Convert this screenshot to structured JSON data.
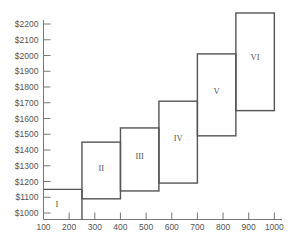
{
  "chart_data": {
    "type": "bar",
    "subtype": "variable-width step boxes",
    "title": "",
    "xlabel": "",
    "ylabel": "",
    "x_ticks": [
      100,
      200,
      300,
      400,
      500,
      600,
      700,
      800,
      900,
      1000
    ],
    "y_ticks": [
      "$1000",
      "$1100",
      "$1200",
      "$1300",
      "$1400",
      "$1500",
      "$1600",
      "$1700",
      "$1800",
      "$1900",
      "$2000",
      "$2100",
      "$2200"
    ],
    "xlim": [
      100,
      1050
    ],
    "ylim": [
      960,
      2280
    ],
    "grid": false,
    "legend": null,
    "boxes": [
      {
        "label": "I",
        "x_start": 100,
        "x_end": 250,
        "y_low": 960,
        "y_high": 1150
      },
      {
        "label": "II",
        "x_start": 250,
        "x_end": 400,
        "y_low": 1090,
        "y_high": 1450
      },
      {
        "label": "III",
        "x_start": 400,
        "x_end": 550,
        "y_low": 1140,
        "y_high": 1540
      },
      {
        "label": "IV",
        "x_start": 550,
        "x_end": 700,
        "y_low": 1190,
        "y_high": 1710
      },
      {
        "label": "V",
        "x_start": 700,
        "x_end": 850,
        "y_low": 1490,
        "y_high": 2010
      },
      {
        "label": "VI",
        "x_start": 850,
        "x_end": 1000,
        "y_low": 1650,
        "y_high": 2270
      }
    ]
  },
  "colors": {
    "line": "#555555",
    "axis": "#777777",
    "text": "#555555",
    "background": "#ffffff"
  }
}
